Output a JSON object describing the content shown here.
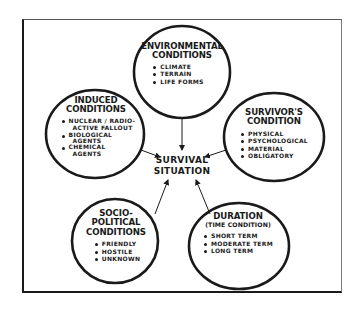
{
  "diagram": {
    "center": {
      "line1": "SURVIVAL",
      "line2": "SITUATION"
    },
    "nodes": {
      "environmental": {
        "title_line1": "ENVIRONMENTAL",
        "title_line2": "CONDITIONS",
        "items": [
          "CLIMATE",
          "TERRAIN",
          "LIFE FORMS"
        ]
      },
      "induced": {
        "title_line1": "INDUCED",
        "title_line2": "CONDITIONS",
        "items": [
          {
            "line1": "NUCLEAR / RADIO-",
            "line2": "ACTIVE FALLOUT"
          },
          {
            "line1": "BIOLOGICAL",
            "line2": "AGENTS"
          },
          {
            "line1": "CHEMICAL",
            "line2": "AGENTS"
          }
        ]
      },
      "survivor": {
        "title_line1": "SURVIVOR'S",
        "title_line2": "CONDITION",
        "items": [
          "PHYSICAL",
          "PSYCHOLOGICAL",
          "MATERIAL",
          "OBLIGATORY"
        ]
      },
      "socio_political": {
        "title_line1": "SOCIO-",
        "title_line2": "POLITICAL",
        "title_line3": "CONDITIONS",
        "items": [
          "FRIENDLY",
          "HOSTILE",
          "UNKNOWN"
        ]
      },
      "duration": {
        "title_line1": "DURATION",
        "subtitle": "(TIME CONDITION)",
        "items": [
          "SHORT TERM",
          "MODERATE TERM",
          "LONG TERM"
        ]
      }
    },
    "colors": {
      "ink": "#1a1a1a",
      "background": "#ffffff"
    }
  }
}
